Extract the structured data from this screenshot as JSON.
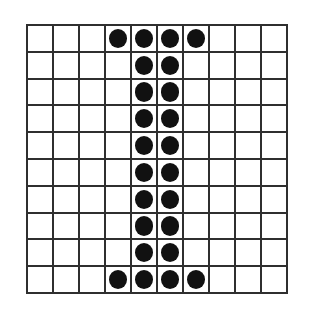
{
  "figure": {
    "kind": "dot-matrix-grid",
    "depicts": "capital letter I",
    "background_color": "#ffffff",
    "grid_line_color": "#2f2f2f",
    "dot_color": "#111111",
    "rows": 10,
    "columns": 10
  },
  "chart_data": {
    "type": "heatmap",
    "title": "",
    "xlabel": "",
    "ylabel": "",
    "rows": 10,
    "columns": 10,
    "row_labels": [
      "1",
      "2",
      "3",
      "4",
      "5",
      "6",
      "7",
      "8",
      "9",
      "10"
    ],
    "column_labels": [
      "1",
      "2",
      "3",
      "4",
      "5",
      "6",
      "7",
      "8",
      "9",
      "10"
    ],
    "legend": [
      {
        "value": 1,
        "label": "filled",
        "color": "#111111"
      },
      {
        "value": 0,
        "label": "empty",
        "color": "#ffffff"
      }
    ],
    "grid": true,
    "values": [
      [
        0,
        0,
        0,
        1,
        1,
        1,
        1,
        0,
        0,
        0
      ],
      [
        0,
        0,
        0,
        0,
        1,
        1,
        0,
        0,
        0,
        0
      ],
      [
        0,
        0,
        0,
        0,
        1,
        1,
        0,
        0,
        0,
        0
      ],
      [
        0,
        0,
        0,
        0,
        1,
        1,
        0,
        0,
        0,
        0
      ],
      [
        0,
        0,
        0,
        0,
        1,
        1,
        0,
        0,
        0,
        0
      ],
      [
        0,
        0,
        0,
        0,
        1,
        1,
        0,
        0,
        0,
        0
      ],
      [
        0,
        0,
        0,
        0,
        1,
        1,
        0,
        0,
        0,
        0
      ],
      [
        0,
        0,
        0,
        0,
        1,
        1,
        0,
        0,
        0,
        0
      ],
      [
        0,
        0,
        0,
        0,
        1,
        1,
        0,
        0,
        0,
        0
      ],
      [
        0,
        0,
        0,
        1,
        1,
        1,
        1,
        0,
        0,
        0
      ]
    ]
  }
}
